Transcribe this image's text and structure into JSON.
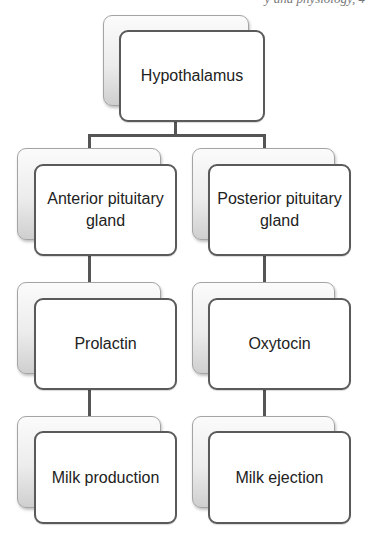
{
  "header": {
    "fragment": "y and physiology, 4"
  },
  "diagram": {
    "type": "hierarchy",
    "colors": {
      "front_border": "#5a5a5a",
      "back_border": "#a4a4a4",
      "connector": "#555555",
      "text": "#222222"
    },
    "root": {
      "label": "Hypothalamus"
    },
    "branches": [
      {
        "gland": "Anterior pituitary gland",
        "hormone": "Prolactin",
        "effect": "Milk production"
      },
      {
        "gland": "Posterior pituitary gland",
        "hormone": "Oxytocin",
        "effect": "Milk ejection"
      }
    ]
  }
}
